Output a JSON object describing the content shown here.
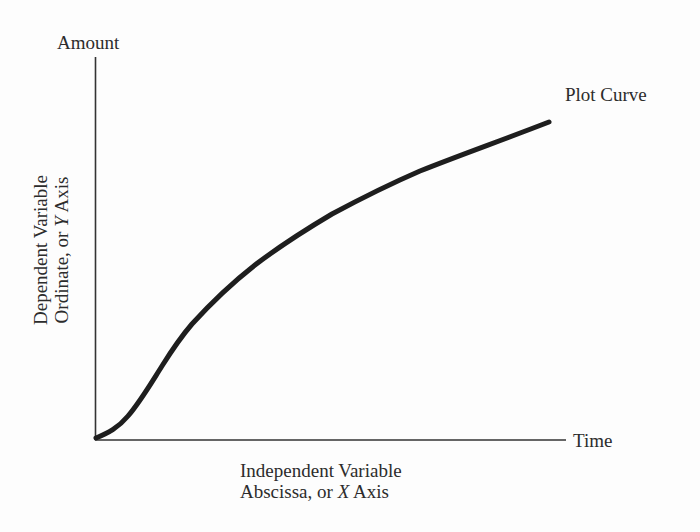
{
  "diagram": {
    "y_axis": {
      "top_label": "Amount",
      "title_line1": "Dependent Variable",
      "title_line2_prefix": "Ordinate, or ",
      "title_line2_var": "Y",
      "title_line2_suffix": " Axis"
    },
    "x_axis": {
      "end_label": "Time",
      "title_line1": "Independent Variable",
      "title_line2_prefix": "Abscissa, or ",
      "title_line2_var": "X",
      "title_line2_suffix": " Axis"
    },
    "curve": {
      "label": "Plot Curve",
      "color": "#1e1e1e"
    },
    "axis_color": "#333333"
  }
}
